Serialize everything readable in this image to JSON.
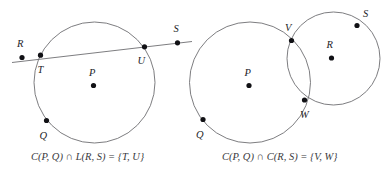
{
  "figure": {
    "background_color": "#ffffff",
    "stroke_color": "#6e6e72",
    "dot_color": "#111115",
    "label_color": "#242428",
    "caption_color": "#3a3a3e"
  },
  "panels": [
    {
      "id": "left-panel",
      "name": "circle-line-intersection",
      "caption": "C(P, Q) ∩ L(R, S) = {T, U}",
      "circles": [
        {
          "name": "circle-P-Q",
          "cx": 94.5,
          "cy": 82.5,
          "r": 60.5
        }
      ],
      "lines": [
        {
          "name": "line-R-S",
          "x1": 12,
          "y1": 62.5,
          "x2": 192,
          "y2": 41.5
        }
      ],
      "points": [
        {
          "name": "point-R",
          "label": "R",
          "x": 22.0,
          "y": 57.5,
          "lx": 17.0,
          "ly": 47.0
        },
        {
          "name": "point-T",
          "label": "T",
          "x": 40.5,
          "y": 55.2,
          "lx": 37.5,
          "ly": 73.0
        },
        {
          "name": "point-U",
          "label": "U",
          "x": 144.5,
          "y": 46.8,
          "lx": 137.5,
          "ly": 64.0
        },
        {
          "name": "point-S",
          "label": "S",
          "x": 177.5,
          "y": 42.8,
          "lx": 173.5,
          "ly": 31.5
        },
        {
          "name": "point-P",
          "label": "P",
          "x": 93.5,
          "y": 85.5,
          "lx": 89.0,
          "ly": 76.0
        },
        {
          "name": "point-Q",
          "label": "Q",
          "x": 46.5,
          "y": 120.5,
          "lx": 39.5,
          "ly": 138.5
        }
      ],
      "caption_x": 31,
      "caption_y": 160
    },
    {
      "id": "right-panel",
      "name": "circle-circle-intersection",
      "caption": "C(P, Q) ∩ C(R, S) = {V, W}",
      "circles": [
        {
          "name": "circle-P-Q",
          "cx": 250.0,
          "cy": 82.5,
          "r": 60.5
        },
        {
          "name": "circle-R-S",
          "cx": 333.5,
          "cy": 58.5,
          "r": 46.5
        }
      ],
      "lines": [],
      "points": [
        {
          "name": "point-V",
          "label": "V",
          "x": 291.5,
          "y": 40.5,
          "lx": 285.0,
          "ly": 31.0
        },
        {
          "name": "point-W",
          "label": "W",
          "x": 304.5,
          "y": 100.0,
          "lx": 300.0,
          "ly": 117.5
        },
        {
          "name": "point-S",
          "label": "S",
          "x": 357.0,
          "y": 25.5,
          "lx": 363.0,
          "ly": 16.5
        },
        {
          "name": "point-R",
          "label": "R",
          "x": 331.5,
          "y": 58.0,
          "lx": 326.5,
          "ly": 48.0
        },
        {
          "name": "point-P",
          "label": "P",
          "x": 249.0,
          "y": 85.5,
          "lx": 244.5,
          "ly": 76.0
        },
        {
          "name": "point-Q",
          "label": "Q",
          "x": 203.0,
          "y": 119.5,
          "lx": 196.0,
          "ly": 137.5
        }
      ],
      "caption_x": 222,
      "caption_y": 160
    }
  ]
}
